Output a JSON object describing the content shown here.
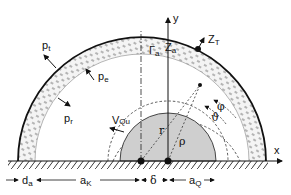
{
  "diagram": {
    "labels": {
      "y_axis": "y",
      "x_axis": "x",
      "pt": {
        "base": "p",
        "sub": "t"
      },
      "pe": {
        "base": "p",
        "sub": "e"
      },
      "pr": {
        "base": "p",
        "sub": "r"
      },
      "gamma_a": {
        "base": "Γ",
        "sub": "a"
      },
      "z_a": {
        "base": "Z",
        "sub": "a"
      },
      "z_t": {
        "base": "Z",
        "sub": "T"
      },
      "v_qu": {
        "base": "V",
        "sub": "Qu"
      },
      "r": "r",
      "rho": "ρ",
      "phi": "φ",
      "theta": "ϑ",
      "d_a": {
        "base": "d",
        "sub": "a"
      },
      "a_k": {
        "base": "a",
        "sub": "K"
      },
      "delta": "δ",
      "a_q": {
        "base": "a",
        "sub": "Q"
      }
    },
    "colors": {
      "line": "#111111",
      "source_fill": "#cfcfcf",
      "wall_fill": "#f2f2f2",
      "background": "#ffffff"
    }
  }
}
